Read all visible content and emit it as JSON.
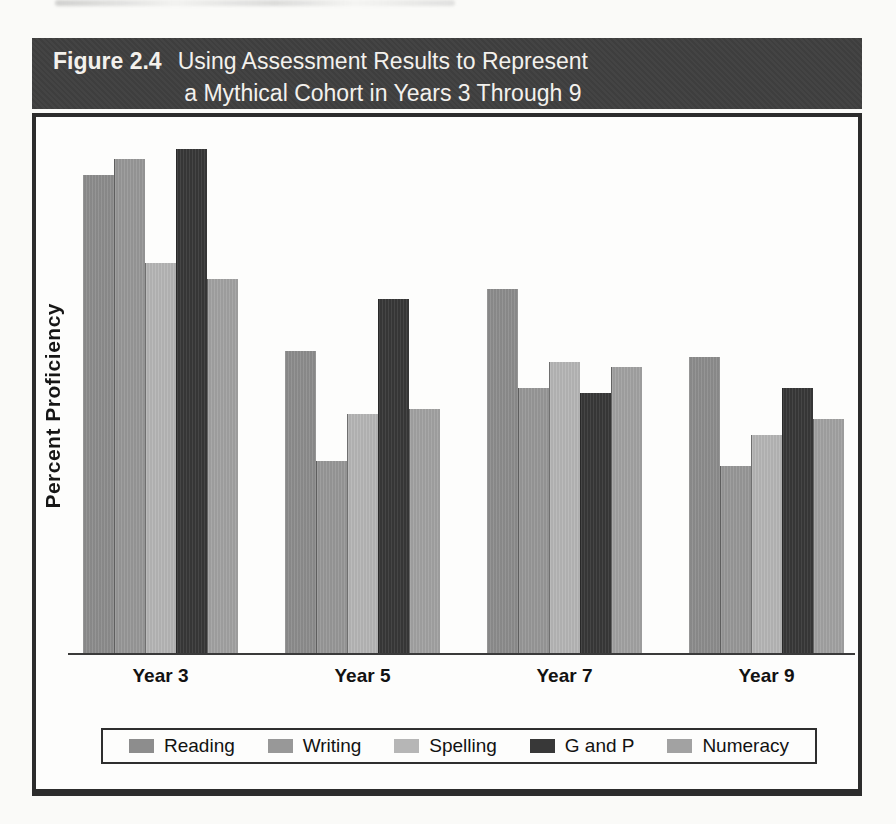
{
  "figure": {
    "label": "Figure 2.4",
    "title_line1": "Using Assessment Results to Represent",
    "title_line2": "a Mythical Cohort in Years 3 Through 9"
  },
  "chart_data": {
    "type": "bar",
    "title": "Figure 2.4 Using Assessment Results to Represent a Mythical Cohort in Years 3 Through 9",
    "xlabel": "",
    "ylabel": "Percent Proficiency",
    "ylim": [
      0,
      100
    ],
    "grid": false,
    "legend_position": "bottom",
    "categories": [
      "Year 3",
      "Year 5",
      "Year 7",
      "Year 9"
    ],
    "series": [
      {
        "name": "Reading",
        "color": "#8d8d8d",
        "values": [
          92,
          58,
          70,
          57
        ]
      },
      {
        "name": "Writing",
        "color": "#989898",
        "values": [
          95,
          37,
          51,
          36
        ]
      },
      {
        "name": "Spelling",
        "color": "#b6b6b6",
        "values": [
          75,
          46,
          56,
          42
        ]
      },
      {
        "name": "G and P",
        "color": "#383838",
        "values": [
          97,
          68,
          50,
          51
        ]
      },
      {
        "name": "Numeracy",
        "color": "#a2a2a2",
        "values": [
          72,
          47,
          55,
          45
        ]
      }
    ]
  },
  "colors": {
    "header_bg": "#404040",
    "header_text": "#f3f1ed",
    "axis": "#3a3a3a",
    "box_border": "#2c2c2c"
  }
}
